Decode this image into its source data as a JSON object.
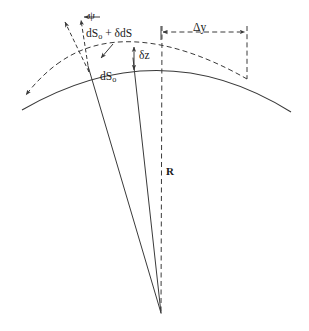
{
  "figure": {
    "background_color": "#ffffff",
    "stroke_color": "#3a3a3a",
    "text_color": "#1a1a1a",
    "width": 309,
    "height": 331
  },
  "labels": {
    "psi": "ψ",
    "ds_deformed_prefix": "dS",
    "ds_deformed_subscript": "o",
    "ds_deformed_suffix": " + δdS",
    "delta_z": "δz",
    "ds_original_prefix": "dS",
    "ds_original_subscript": "o",
    "delta_y": "Δy",
    "radius": "R"
  },
  "geometry": {
    "center": {
      "x": 161,
      "y": 313
    },
    "apex": {
      "x": 162,
      "y": 62
    },
    "solid_arc": {
      "description": "undeformed arc",
      "left_end": {
        "x": 22,
        "y": 110
      },
      "right_end": {
        "x": 291,
        "y": 112
      },
      "control": {
        "x": 160,
        "y": 38
      }
    },
    "dashed_arc": {
      "description": "deformed arc",
      "left_end": {
        "x": 24,
        "y": 96
      },
      "right_end": {
        "x": 247,
        "y": 79
      },
      "control": {
        "x": 140,
        "y": 22
      }
    },
    "radius_line": {
      "top": {
        "x": 162,
        "y": 50
      },
      "bottom": {
        "x": 161,
        "y": 313
      },
      "style": "dashed"
    },
    "radial_line_left": {
      "top": {
        "x": 88,
        "y": 66
      },
      "bottom": {
        "x": 161,
        "y": 313
      },
      "style": "solid"
    },
    "radial_line_right": {
      "top": {
        "x": 133,
        "y": 58
      },
      "bottom": {
        "x": 161,
        "y": 313
      },
      "style": "solid"
    },
    "psi_angle_lines": {
      "vertex": {
        "x": 89,
        "y": 70
      },
      "line_a_tip": {
        "x": 64,
        "y": 19
      },
      "line_b_tip": {
        "x": 80,
        "y": 16
      },
      "style": "dashed"
    },
    "delta_y_dimension": {
      "y": 32,
      "x_start": 161,
      "x_end": 247,
      "style": "dashed"
    },
    "delta_z_arrow": {
      "x": 134,
      "y_top": 48,
      "y_bottom": 69
    },
    "drop_line_right": {
      "x": 247,
      "y_top": 26,
      "y_bottom": 79,
      "style": "dashed"
    },
    "drop_line_left": {
      "x": 161,
      "y_top": 26,
      "y_bottom": 62,
      "style": "dashed"
    }
  }
}
